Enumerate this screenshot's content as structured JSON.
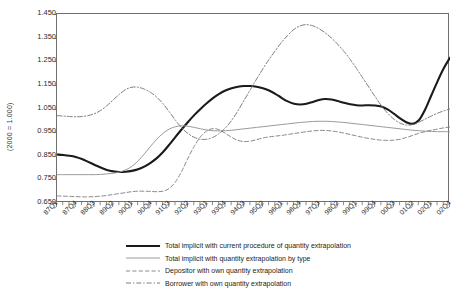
{
  "chart_data": {
    "type": "line",
    "title": "",
    "xlabel": "",
    "ylabel": "(2000 = 1.000)",
    "ylim": [
      0.65,
      1.45
    ],
    "ytick_labels": [
      "1.450",
      "1.350",
      "1.250",
      "1.150",
      "1.050",
      "0.950",
      "0.850",
      "0.750",
      "0.650"
    ],
    "ytick_values": [
      1.45,
      1.35,
      1.25,
      1.15,
      1.05,
      0.95,
      0.85,
      0.75,
      0.65
    ],
    "grid": false,
    "legend_position": "bottom",
    "x_all_quarters": [
      "87Q1",
      "87Q2",
      "87Q3",
      "87Q4",
      "88Q1",
      "88Q2",
      "88Q3",
      "88Q4",
      "89Q1",
      "89Q2",
      "89Q3",
      "89Q4",
      "90Q1",
      "90Q2",
      "90Q3",
      "90Q4",
      "91Q1",
      "91Q2",
      "91Q3",
      "91Q4",
      "92Q1",
      "92Q2",
      "92Q3",
      "92Q4",
      "93Q1",
      "93Q2",
      "93Q3",
      "93Q4",
      "94Q1",
      "94Q2",
      "94Q3",
      "94Q4",
      "95Q1",
      "95Q2",
      "95Q3",
      "95Q4",
      "96Q1",
      "96Q2",
      "96Q3",
      "96Q4",
      "97Q1",
      "97Q2",
      "97Q3",
      "97Q4",
      "98Q1",
      "98Q2",
      "98Q3",
      "98Q4",
      "99Q1",
      "99Q2",
      "99Q3",
      "99Q4",
      "00Q1",
      "00Q2",
      "00Q3",
      "00Q4",
      "01Q1",
      "01Q2",
      "01Q3",
      "01Q4",
      "02Q1",
      "02Q2",
      "02Q3",
      "02Q4"
    ],
    "xtick_labels": [
      "87Q1",
      "87Q4",
      "88Q3",
      "89Q2",
      "90Q1",
      "90Q4",
      "91Q3",
      "92Q2",
      "93Q1",
      "93Q4",
      "94Q3",
      "95Q2",
      "96Q1",
      "96Q4",
      "97Q3",
      "98Q2",
      "99Q1",
      "99Q4",
      "00Q3",
      "01Q2",
      "02Q1",
      "02Q4"
    ],
    "xtick_indices": [
      0,
      3,
      6,
      9,
      12,
      15,
      18,
      21,
      24,
      27,
      30,
      33,
      36,
      39,
      42,
      45,
      48,
      51,
      54,
      57,
      60,
      63
    ],
    "series": [
      {
        "name": "Total implicit with current procedure of quantity extrapolation",
        "style": "solid-thick",
        "color": "#1a1a1a",
        "width": 2.1,
        "values": [
          0.855,
          0.853,
          0.85,
          0.845,
          0.836,
          0.824,
          0.812,
          0.8,
          0.79,
          0.784,
          0.781,
          0.782,
          0.786,
          0.793,
          0.804,
          0.82,
          0.84,
          0.866,
          0.897,
          0.93,
          0.962,
          0.993,
          1.022,
          1.048,
          1.072,
          1.094,
          1.112,
          1.126,
          1.136,
          1.142,
          1.145,
          1.145,
          1.142,
          1.136,
          1.126,
          1.112,
          1.095,
          1.08,
          1.07,
          1.067,
          1.07,
          1.078,
          1.086,
          1.09,
          1.088,
          1.082,
          1.074,
          1.068,
          1.064,
          1.063,
          1.064,
          1.063,
          1.058,
          1.046,
          1.028,
          1.008,
          0.992,
          0.985,
          1.0,
          1.045,
          1.105,
          1.165,
          1.22,
          1.265
        ]
      },
      {
        "name": "Total implicit with quantity extrapolation by type",
        "style": "solid-thin",
        "color": "#9a9a9a",
        "width": 1.0,
        "values": [
          0.77,
          0.77,
          0.77,
          0.77,
          0.77,
          0.77,
          0.77,
          0.771,
          0.773,
          0.776,
          0.781,
          0.79,
          0.805,
          0.828,
          0.858,
          0.89,
          0.92,
          0.945,
          0.963,
          0.973,
          0.977,
          0.975,
          0.97,
          0.964,
          0.959,
          0.956,
          0.955,
          0.956,
          0.958,
          0.961,
          0.964,
          0.967,
          0.97,
          0.973,
          0.976,
          0.979,
          0.982,
          0.985,
          0.988,
          0.991,
          0.993,
          0.995,
          0.996,
          0.996,
          0.995,
          0.993,
          0.991,
          0.988,
          0.985,
          0.982,
          0.979,
          0.976,
          0.973,
          0.97,
          0.967,
          0.964,
          0.961,
          0.958,
          0.956,
          0.954,
          0.953,
          0.952,
          0.952,
          0.952
        ]
      },
      {
        "name": "Depositor with own quantity extrapolation",
        "style": "dashed",
        "color": "#8a8a8a",
        "width": 1.0,
        "values": [
          0.68,
          0.679,
          0.678,
          0.677,
          0.676,
          0.676,
          0.677,
          0.679,
          0.682,
          0.686,
          0.69,
          0.694,
          0.698,
          0.7,
          0.7,
          0.699,
          0.698,
          0.7,
          0.712,
          0.74,
          0.785,
          0.84,
          0.89,
          0.93,
          0.955,
          0.965,
          0.96,
          0.945,
          0.928,
          0.915,
          0.91,
          0.912,
          0.918,
          0.925,
          0.93,
          0.933,
          0.936,
          0.94,
          0.944,
          0.948,
          0.952,
          0.955,
          0.957,
          0.957,
          0.955,
          0.951,
          0.946,
          0.94,
          0.934,
          0.928,
          0.923,
          0.919,
          0.916,
          0.915,
          0.916,
          0.92,
          0.927,
          0.936,
          0.945,
          0.952,
          0.958,
          0.963,
          0.968,
          0.972
        ]
      },
      {
        "name": "Borrower with own quantity extrapolation",
        "style": "dash-dot",
        "color": "#7d7d7d",
        "width": 1.0,
        "values": [
          1.02,
          1.018,
          1.016,
          1.015,
          1.016,
          1.02,
          1.028,
          1.042,
          1.062,
          1.086,
          1.11,
          1.13,
          1.14,
          1.14,
          1.132,
          1.118,
          1.098,
          1.07,
          1.036,
          1.0,
          0.968,
          0.944,
          0.928,
          0.92,
          0.92,
          0.928,
          0.944,
          0.968,
          1.0,
          1.04,
          1.085,
          1.13,
          1.175,
          1.218,
          1.258,
          1.295,
          1.33,
          1.36,
          1.385,
          1.4,
          1.405,
          1.4,
          1.388,
          1.37,
          1.348,
          1.322,
          1.292,
          1.258,
          1.22,
          1.18,
          1.14,
          1.1,
          1.062,
          1.03,
          1.005,
          0.988,
          0.98,
          0.982,
          0.992,
          1.005,
          1.018,
          1.03,
          1.04,
          1.048
        ]
      }
    ]
  },
  "legend": {
    "items": [
      {
        "label": "Total implicit with current procedure of quantity extrapolation"
      },
      {
        "label": "Total implicit with quantity extrapolation by type"
      },
      {
        "label": "Depositor with own quantity extrapolation"
      },
      {
        "label": "Borrower with own quantity extrapolation"
      }
    ]
  }
}
